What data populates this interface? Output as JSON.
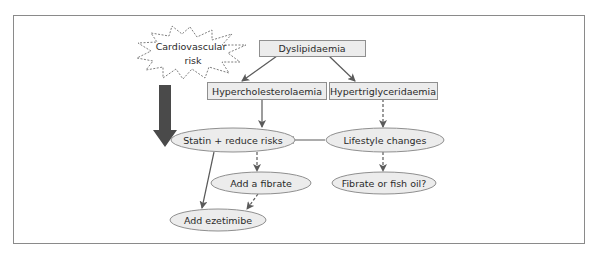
{
  "diagram": {
    "type": "flowchart",
    "colors": {
      "frame": "#8a8a8a",
      "box_fill": "#ececec",
      "box_stroke": "#8f8f8f",
      "arrow": "#5a5a5a",
      "thick_arrow": "#4a4a4a",
      "text": "#2a2a2a"
    },
    "nodes": {
      "cv_risk": {
        "label_line1": "Cardiovascular",
        "label_line2": "risk",
        "shape": "starburst-dashed"
      },
      "dyslipidaemia": {
        "label": "Dyslipidaemia",
        "shape": "rectangle"
      },
      "hypercholesterolaemia": {
        "label": "Hypercholesterolaemia",
        "shape": "rectangle"
      },
      "hypertriglyceridaemia": {
        "label": "Hypertriglyceridaemia",
        "shape": "rectangle"
      },
      "statin": {
        "label": "Statin + reduce risks",
        "shape": "ellipse"
      },
      "lifestyle": {
        "label": "Lifestyle changes",
        "shape": "ellipse"
      },
      "add_fibrate": {
        "label": "Add a fibrate",
        "shape": "ellipse"
      },
      "fibrate_or_fish_oil": {
        "label": "Fibrate or fish oil?",
        "shape": "ellipse"
      },
      "add_ezetimibe": {
        "label": "Add ezetimibe",
        "shape": "ellipse"
      }
    },
    "edges": [
      {
        "from": "dyslipidaemia",
        "to": "hypercholesterolaemia",
        "style": "solid"
      },
      {
        "from": "dyslipidaemia",
        "to": "hypertriglyceridaemia",
        "style": "solid"
      },
      {
        "from": "hypercholesterolaemia",
        "to": "statin",
        "style": "solid"
      },
      {
        "from": "hypertriglyceridaemia",
        "to": "lifestyle",
        "style": "dashed"
      },
      {
        "from": "lifestyle",
        "to": "statin",
        "style": "solid"
      },
      {
        "from": "lifestyle",
        "to": "fibrate_or_fish_oil",
        "style": "dashed"
      },
      {
        "from": "statin",
        "to": "add_fibrate",
        "style": "dashed"
      },
      {
        "from": "statin",
        "to": "add_ezetimibe",
        "style": "solid"
      },
      {
        "from": "add_fibrate",
        "to": "add_ezetimibe",
        "style": "dashed"
      },
      {
        "from": "cv_risk",
        "to": "statin",
        "style": "thick"
      }
    ]
  }
}
